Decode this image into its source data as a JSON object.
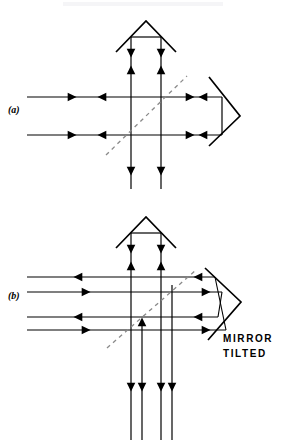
{
  "figure": {
    "title_visible": false,
    "background_color": "#ffffff",
    "stroke_color": "#000000",
    "dashed_color": "#8a8a8a",
    "width": 287,
    "height": 445
  },
  "panels": [
    {
      "id": "a",
      "label": "(a)",
      "description": "Interferometer with roof prism, beamsplitter and corner prism, mirror aligned",
      "horizontal_ray_count": 2,
      "vertical_ray_count": 2,
      "note": ""
    },
    {
      "id": "b",
      "label": "(b)",
      "description": "Same interferometer with mirror tilted, rays split into pairs",
      "horizontal_ray_count": 4,
      "vertical_ray_count": 4,
      "note": "MIRROR TILTED"
    }
  ],
  "annotations": {
    "mirror_tilted_line1": "MIRROR",
    "mirror_tilted_line2": "TILTED"
  },
  "elements": {
    "roof_prism": "roof-prism",
    "corner_prism": "corner-prism",
    "beamsplitter": "beamsplitter-dashed-line",
    "ray": "light-ray",
    "arrowhead": "ray-direction-arrowhead"
  }
}
